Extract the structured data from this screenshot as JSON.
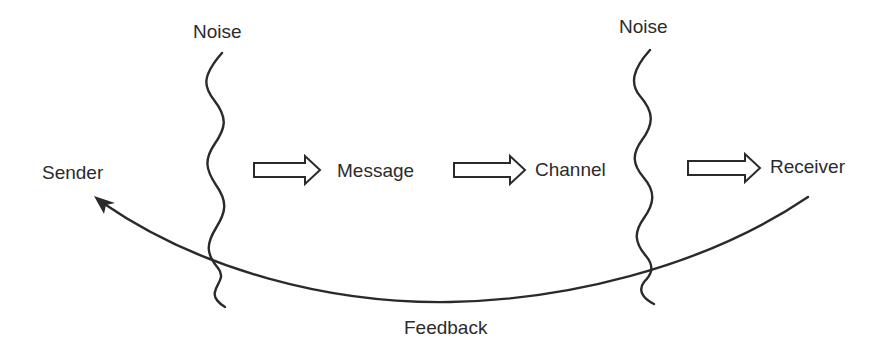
{
  "diagram": {
    "type": "communication-model",
    "nodes": {
      "sender": "Sender",
      "message": "Message",
      "channel": "Channel",
      "receiver": "Receiver"
    },
    "noise": {
      "left": "Noise",
      "right": "Noise"
    },
    "feedback": "Feedback",
    "edges": [
      {
        "from": "Sender",
        "to": "Message",
        "style": "hollow-block-arrow"
      },
      {
        "from": "Message",
        "to": "Channel",
        "style": "hollow-block-arrow"
      },
      {
        "from": "Channel",
        "to": "Receiver",
        "style": "hollow-block-arrow"
      },
      {
        "from": "Receiver",
        "to": "Sender",
        "style": "curved-arrow",
        "label": "Feedback"
      }
    ],
    "colors": {
      "stroke": "#2a2a2a",
      "background": "#ffffff"
    }
  }
}
